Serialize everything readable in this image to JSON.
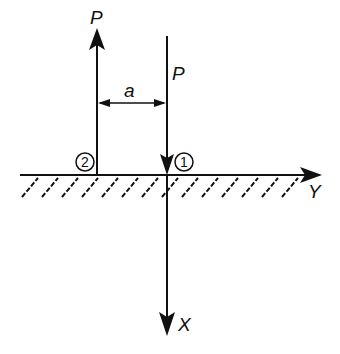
{
  "diagram": {
    "type": "force-diagram",
    "forces": [
      {
        "id": "force-2",
        "label": "P",
        "direction": "up",
        "point": "2"
      },
      {
        "id": "force-1",
        "label": "P",
        "direction": "down",
        "point": "1"
      }
    ],
    "dimension": {
      "label": "a"
    },
    "points": [
      {
        "id": "2",
        "label": "2"
      },
      {
        "id": "1",
        "label": "1"
      }
    ],
    "axes": {
      "horizontal": {
        "label": "Y"
      },
      "vertical": {
        "label": "X"
      }
    },
    "colors": {
      "ink": "#111111",
      "background": "#ffffff"
    }
  }
}
